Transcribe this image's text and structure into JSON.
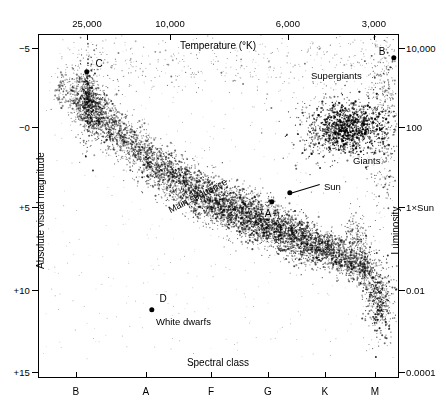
{
  "chart_data": {
    "type": "scatter",
    "title": "",
    "xlabel": "Spectral class",
    "xlabel_top": "Temperature (°K)",
    "ylabel": "Absolute visual magnitude",
    "ylabel_right": "Luminosity",
    "grid": false,
    "legend": "none",
    "axes": {
      "top": {
        "name": "Temperature (°K)",
        "ticks": [
          {
            "label": "25,000",
            "x_px": 87
          },
          {
            "label": "10,000",
            "x_px": 170
          },
          {
            "label": "6,000",
            "x_px": 288
          },
          {
            "label": "3,000",
            "x_px": 374
          }
        ]
      },
      "bottom": {
        "name": "Spectral class",
        "ticks": [
          {
            "label": "B",
            "x_px": 76
          },
          {
            "label": "A",
            "x_px": 146
          },
          {
            "label": "F",
            "x_px": 211
          },
          {
            "label": "G",
            "x_px": 268
          },
          {
            "label": "K",
            "x_px": 325
          },
          {
            "label": "M",
            "x_px": 375
          }
        ]
      },
      "left": {
        "name": "Absolute visual magnitude",
        "ticks": [
          {
            "label": "−5",
            "y_px": 48
          },
          {
            "label": "−0",
            "y_px": 127
          },
          {
            "label": "+5",
            "y_px": 207
          },
          {
            "label": "+10",
            "y_px": 290
          },
          {
            "label": "+15",
            "y_px": 372
          }
        ]
      },
      "right": {
        "name": "Luminosity",
        "ticks": [
          {
            "label": "10,000",
            "y_px": 48
          },
          {
            "label": "100",
            "y_px": 127
          },
          {
            "label": "1×Sun",
            "y_px": 207
          },
          {
            "label": "0.01",
            "y_px": 290
          },
          {
            "label": "0.0001",
            "y_px": 372
          }
        ]
      }
    },
    "annotations": [
      {
        "name": "supergiants",
        "text": "Supergiants",
        "x_px": 310,
        "y_px": 70
      },
      {
        "name": "giants",
        "text": "Giants",
        "x_px": 352,
        "y_px": 155
      },
      {
        "name": "sun",
        "text": "Sun",
        "x_px": 323,
        "y_px": 181
      },
      {
        "name": "main-sequence",
        "text": "Main sequence",
        "x_px": 168,
        "y_px": 205,
        "rotation_deg": -27
      },
      {
        "name": "white-dwarfs",
        "text": "White dwarfs",
        "x_px": 155,
        "y_px": 316
      }
    ],
    "marked_points": [
      {
        "label": "C",
        "x_px": 87,
        "y_px": 72,
        "label_x_px": 99,
        "label_y_px": 63
      },
      {
        "label": "B",
        "x_px": 394,
        "y_px": 58,
        "label_x_px": 382,
        "label_y_px": 51
      },
      {
        "label": "A",
        "x_px": 272,
        "y_px": 202,
        "label_x_px": 268,
        "label_y_px": 213
      },
      {
        "label": "D",
        "x_px": 152,
        "y_px": 310,
        "label_x_px": 163,
        "label_y_px": 298
      }
    ],
    "sun_marker": {
      "x_px": 290,
      "y_px": 193,
      "leader_to_x_px": 320,
      "leader_to_y_px": 184
    },
    "populations": [
      {
        "name": "main-sequence",
        "description": "diagonal band from hot bright upper-left to cool faint lower-right"
      },
      {
        "name": "supergiants",
        "description": "horizontal band near magnitude -5"
      },
      {
        "name": "giants",
        "description": "clump near magnitude 0 at spectral class K"
      },
      {
        "name": "white-dwarfs",
        "description": "faint trail near magnitude +10 to +15 at right"
      }
    ],
    "colors": {
      "ink": "#000000",
      "background": "#ffffff"
    }
  }
}
